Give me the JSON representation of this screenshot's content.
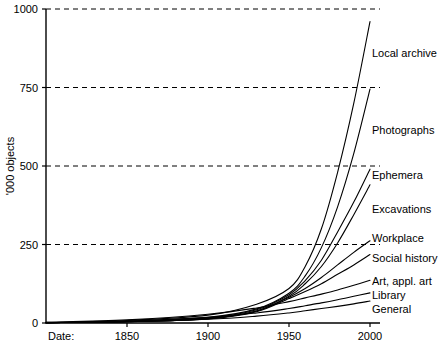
{
  "chart_data": {
    "type": "line",
    "title": "",
    "subtitle": "",
    "xlabel": "Date:",
    "ylabel": "'000 objects",
    "xlim": [
      1800,
      2000
    ],
    "ylim": [
      0,
      1000
    ],
    "grid": "horizontal-dashed",
    "legend_position": "right-inline-labels",
    "x_ticks": [
      "1850",
      "1900",
      "1950",
      "2000"
    ],
    "x_tick_values": [
      1850,
      1900,
      1950,
      2000
    ],
    "y_ticks": [
      "0",
      "250",
      "500",
      "750",
      "1000"
    ],
    "y_tick_values": [
      0,
      250,
      500,
      750,
      1000
    ],
    "x": [
      1800,
      1850,
      1900,
      1930,
      1950,
      1960,
      1970,
      1980,
      1990,
      2000
    ],
    "series": [
      {
        "name": "Local archive",
        "label": "Local archive",
        "values": [
          2,
          8,
          25,
          60,
          110,
          180,
          300,
          480,
          700,
          960
        ]
      },
      {
        "name": "Photographs",
        "label": "Photographs",
        "values": [
          1,
          5,
          18,
          45,
          95,
          150,
          240,
          370,
          540,
          745
        ]
      },
      {
        "name": "Ephemera",
        "label": "Ephemera",
        "values": [
          1,
          5,
          16,
          42,
          90,
          135,
          200,
          290,
          385,
          490
        ]
      },
      {
        "name": "Excavations",
        "label": "Excavations",
        "values": [
          1,
          4,
          14,
          38,
          85,
          125,
          180,
          255,
          345,
          440
        ]
      },
      {
        "name": "Workplace",
        "label": "Workplace",
        "values": [
          1,
          4,
          14,
          38,
          82,
          110,
          145,
          185,
          225,
          262
        ]
      },
      {
        "name": "Social history",
        "label": "Social history",
        "values": [
          1,
          4,
          13,
          36,
          78,
          100,
          125,
          155,
          185,
          218
        ]
      },
      {
        "name": "Art, appl. art",
        "label": "Art, appl. art",
        "values": [
          2,
          10,
          28,
          48,
          68,
          80,
          92,
          105,
          120,
          136
        ]
      },
      {
        "name": "Library",
        "label": "Library",
        "values": [
          1,
          6,
          18,
          32,
          46,
          55,
          64,
          74,
          85,
          96
        ]
      },
      {
        "name": "General",
        "label": "General",
        "values": [
          1,
          4,
          12,
          22,
          32,
          39,
          46,
          53,
          61,
          70
        ]
      }
    ],
    "series_label_positions": [
      {
        "name": "Local archive",
        "y_value": 855
      },
      {
        "name": "Photographs",
        "y_value": 610
      },
      {
        "name": "Ephemera",
        "y_value": 468
      },
      {
        "name": "Excavations",
        "y_value": 360
      },
      {
        "name": "Workplace",
        "y_value": 268
      },
      {
        "name": "Social history",
        "y_value": 205
      },
      {
        "name": "Art, appl. art",
        "y_value": 130
      },
      {
        "name": "Library",
        "y_value": 85
      },
      {
        "name": "General",
        "y_value": 40
      }
    ]
  }
}
